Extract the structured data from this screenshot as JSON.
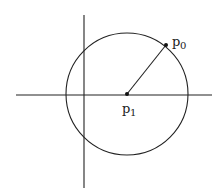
{
  "diagram": {
    "colors": {
      "stroke": "#222222",
      "background": "#ffffff"
    },
    "points": {
      "p0": {
        "label": "p",
        "subscript": "0"
      },
      "p1": {
        "label": "p",
        "subscript": "1"
      }
    }
  }
}
